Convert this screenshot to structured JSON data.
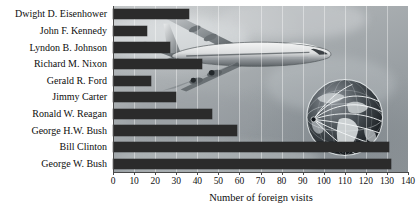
{
  "chart_data": {
    "type": "bar",
    "orientation": "horizontal",
    "title": "",
    "xlabel": "Number of foreign visits",
    "ylabel": "",
    "xlim": [
      0,
      140
    ],
    "xticks": [
      0,
      10,
      20,
      30,
      40,
      50,
      60,
      70,
      80,
      90,
      100,
      110,
      120,
      130,
      140
    ],
    "grid": true,
    "legend": null,
    "categories": [
      "Dwight D. Eisenhower",
      "John F. Kennedy",
      "Lyndon B. Johnson",
      "Richard M. Nixon",
      "Gerald R. Ford",
      "Jimmy Carter",
      "Ronald W. Reagan",
      "George H.W. Bush",
      "Bill Clinton",
      "George W. Bush"
    ],
    "values": [
      36,
      16,
      27,
      42,
      18,
      30,
      47,
      59,
      131,
      132
    ],
    "bar_color": "#2b2b2b",
    "background": "photograph of a jumbo jet in flight with a globe showing flight routes"
  },
  "axis": {
    "tick_labels": [
      "0",
      "10",
      "20",
      "30",
      "40",
      "50",
      "60",
      "70",
      "80",
      "90",
      "100",
      "110",
      "120",
      "130",
      "140"
    ],
    "x_title": "Number of foreign visits"
  },
  "imagery": {
    "jet_label": "jumbo-jet",
    "globe_label": "globe-with-flight-routes"
  }
}
